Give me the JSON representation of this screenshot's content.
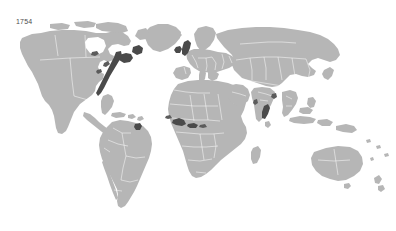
{
  "map": {
    "year_label": "1754",
    "title": "",
    "projection": "world",
    "colors": {
      "background": "#ffffff",
      "land": "#b4b4b4",
      "land_border": "#ffffff",
      "highlight": "#4a4a4a",
      "highlight_soft": "#5c5c5c",
      "label_text": "#4d4d4d"
    },
    "legend": [],
    "highlighted_regions": [
      {
        "name": "thirteen-colonies-and-nova-scotia",
        "continent": "North America"
      },
      {
        "name": "newfoundland",
        "continent": "North America"
      },
      {
        "name": "great-britain-and-ireland",
        "continent": "Europe"
      },
      {
        "name": "gold-coast-forts",
        "continent": "Africa"
      },
      {
        "name": "coastal-india-madras",
        "continent": "Asia"
      },
      {
        "name": "guyana-coast",
        "continent": "South America"
      }
    ],
    "landmasses": [
      {
        "name": "north-america"
      },
      {
        "name": "south-america"
      },
      {
        "name": "greenland"
      },
      {
        "name": "europe"
      },
      {
        "name": "africa"
      },
      {
        "name": "asia"
      },
      {
        "name": "australia"
      },
      {
        "name": "oceania"
      }
    ]
  }
}
